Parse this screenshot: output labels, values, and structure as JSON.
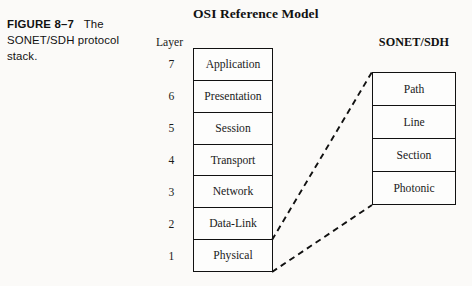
{
  "figure": {
    "caption_label": "FIGURE 8–7",
    "caption_text": "The SONET/SDH protocol stack."
  },
  "osi": {
    "heading": "OSI Reference Model",
    "layer_column_label": "Layer",
    "layer_numbers": [
      "7",
      "6",
      "5",
      "4",
      "3",
      "2",
      "1"
    ],
    "layers": [
      "Application",
      "Presentation",
      "Session",
      "Transport",
      "Network",
      "Data-Link",
      "Physical"
    ]
  },
  "sonet": {
    "heading": "SONET/SDH",
    "layers": [
      "Path",
      "Line",
      "Section",
      "Photonic"
    ]
  },
  "connectors": [
    {
      "name": "physical-to-sonet-top",
      "from": [
        272,
        240
      ],
      "to": [
        372,
        72
      ]
    },
    {
      "name": "physical-to-sonet-bottom",
      "from": [
        272,
        272
      ],
      "to": [
        372,
        205
      ]
    }
  ],
  "style": {
    "ink": "#111111",
    "background": "#fbfaf8",
    "box_fill": "#fdfdfc"
  }
}
